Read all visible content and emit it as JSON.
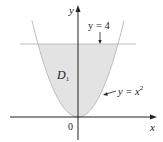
{
  "figure": {
    "type": "region-diagram",
    "axes": {
      "x_label": "x",
      "y_label": "y",
      "origin_label": "0"
    },
    "curves": [
      {
        "name": "parabola",
        "equation_label_base": "y = x",
        "equation_label_sup": "2",
        "expression": "y = x^2"
      },
      {
        "name": "horizontal-line",
        "equation_label": "y = 4",
        "expression": "y = 4"
      }
    ],
    "region": {
      "label_base": "D",
      "label_sub": "1",
      "description": "region between y = x^2 and y = 4",
      "fill_color": "#e3e3e3"
    },
    "colors": {
      "axis": "#222222",
      "curve": "#bdbdbd",
      "line": "#bdbdbd"
    }
  }
}
